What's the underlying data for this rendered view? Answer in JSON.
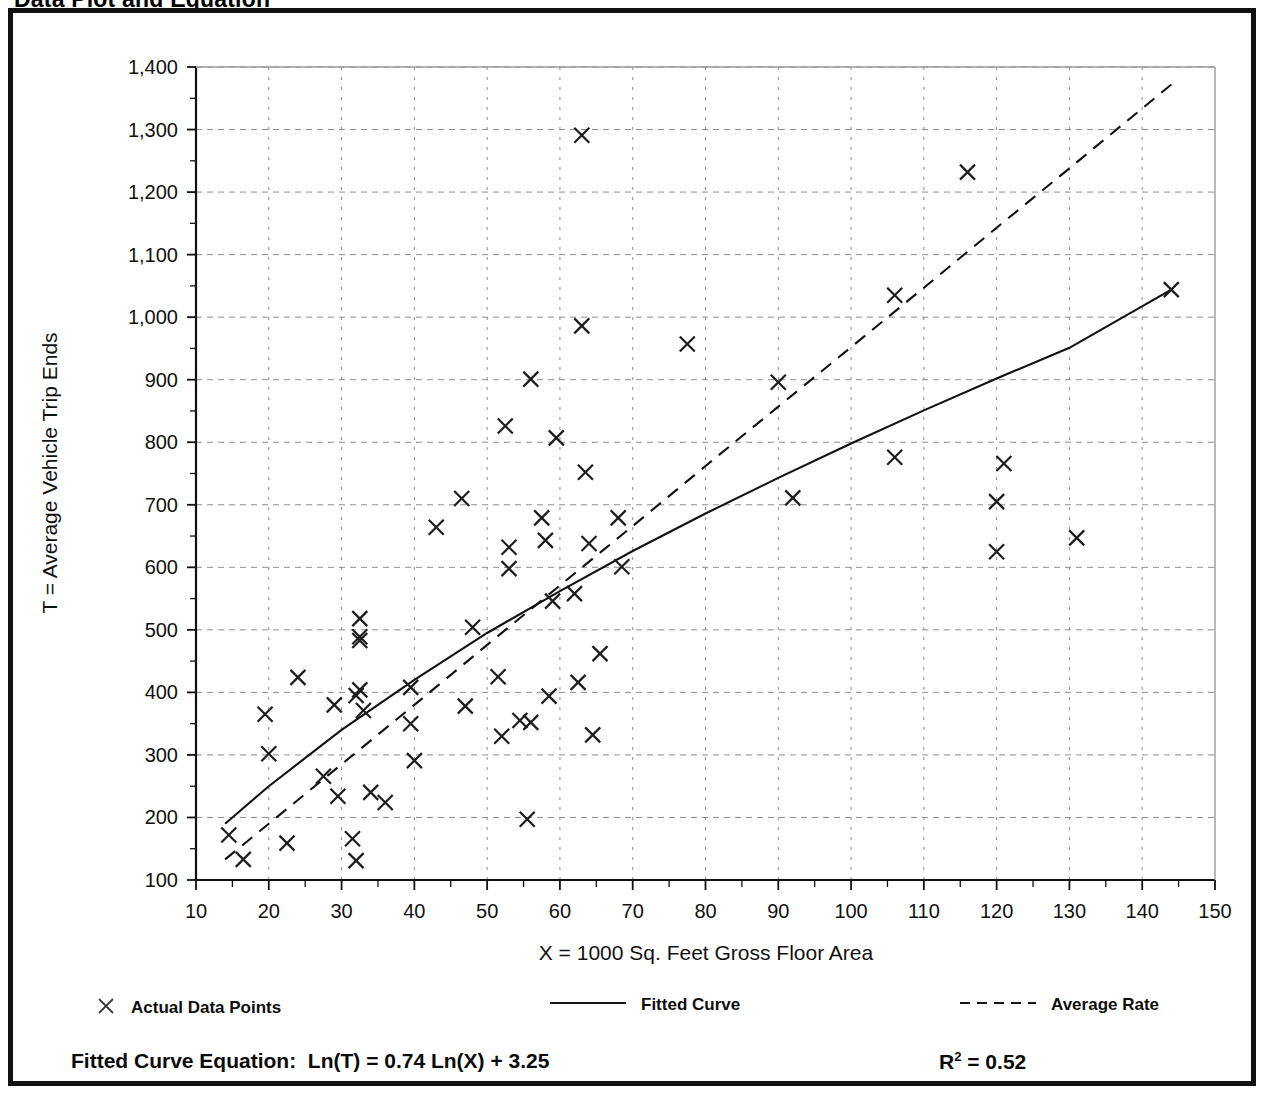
{
  "page_title": "Data Plot and Equation",
  "axes": {
    "y_title": "T = Average Vehicle Trip Ends",
    "x_title": "X = 1000 Sq. Feet Gross Floor Area"
  },
  "legend": {
    "items": [
      {
        "label": "Actual Data Points",
        "marker": "x-marker-icon"
      },
      {
        "label": "Fitted Curve",
        "marker": "solid-line-icon"
      },
      {
        "label": "Average Rate",
        "marker": "dashed-line-icon"
      }
    ]
  },
  "equation": {
    "fitted_label": "Fitted Curve Equation:",
    "fitted_formula": "Ln(T) = 0.74 Ln(X) + 3.25",
    "r_squared_base": "R",
    "r_squared_exp": "2",
    "r_squared_value": "= 0.52"
  },
  "colors": {
    "frame": "#111111",
    "ink": "#111111",
    "grid": "#8d8d8d",
    "marker": "#1d1d1d"
  },
  "chart_data": {
    "type": "scatter",
    "title": "Data Plot and Equation",
    "xlabel": "X = 1000 Sq. Feet Gross Floor Area",
    "ylabel": "T = Average Vehicle Trip Ends",
    "xlim": [
      10,
      150
    ],
    "ylim": [
      100,
      1400
    ],
    "xticks": [
      10,
      20,
      30,
      40,
      50,
      60,
      70,
      80,
      90,
      100,
      110,
      120,
      130,
      140,
      150
    ],
    "yticks": [
      100,
      200,
      300,
      400,
      500,
      600,
      700,
      800,
      900,
      1000,
      1100,
      1200,
      1300,
      1400
    ],
    "ytick_labels": [
      "100",
      "200",
      "300",
      "400",
      "500",
      "600",
      "700",
      "800",
      "900",
      "1,000",
      "1,100",
      "1,200",
      "1,300",
      "1,400"
    ],
    "xtick_labels": [
      "10",
      "20",
      "30",
      "40",
      "50",
      "60",
      "70",
      "80",
      "90",
      "100",
      "110",
      "120",
      "130",
      "140",
      "150"
    ],
    "grid": true,
    "minor_ticks": true,
    "legend_position": "below",
    "series": [
      {
        "name": "Actual Data Points",
        "type": "scatter",
        "marker": "x",
        "points": [
          [
            14.5,
            172
          ],
          [
            16.5,
            133
          ],
          [
            19.5,
            365
          ],
          [
            20,
            302
          ],
          [
            22.5,
            159
          ],
          [
            24,
            424
          ],
          [
            27.5,
            266
          ],
          [
            29,
            380
          ],
          [
            29.5,
            234
          ],
          [
            31.5,
            166
          ],
          [
            32,
            131
          ],
          [
            32,
            395
          ],
          [
            32.5,
            404
          ],
          [
            32.5,
            518
          ],
          [
            32.5,
            489
          ],
          [
            32.5,
            483
          ],
          [
            33,
            371
          ],
          [
            34,
            240
          ],
          [
            36,
            224
          ],
          [
            39.5,
            408
          ],
          [
            39.5,
            350
          ],
          [
            40,
            291
          ],
          [
            43,
            664
          ],
          [
            46.5,
            710
          ],
          [
            47,
            378
          ],
          [
            48,
            504
          ],
          [
            51.5,
            425
          ],
          [
            52,
            330
          ],
          [
            52.5,
            826
          ],
          [
            53,
            632
          ],
          [
            53,
            598
          ],
          [
            54.5,
            355
          ],
          [
            55.5,
            197
          ],
          [
            56,
            352
          ],
          [
            56,
            901
          ],
          [
            57.5,
            679
          ],
          [
            58,
            643
          ],
          [
            58.5,
            394
          ],
          [
            59,
            546
          ],
          [
            59.5,
            807
          ],
          [
            62,
            558
          ],
          [
            62.5,
            416
          ],
          [
            63,
            1291
          ],
          [
            63,
            986
          ],
          [
            63.5,
            752
          ],
          [
            64,
            638
          ],
          [
            64.5,
            332
          ],
          [
            65.5,
            462
          ],
          [
            68,
            679
          ],
          [
            68.5,
            601
          ],
          [
            77.5,
            957
          ],
          [
            90,
            896
          ],
          [
            92,
            711
          ],
          [
            106,
            1035
          ],
          [
            106,
            776
          ],
          [
            116,
            1232
          ],
          [
            120,
            705
          ],
          [
            120,
            625
          ],
          [
            121,
            766
          ],
          [
            131,
            647
          ],
          [
            144,
            1044
          ]
        ]
      },
      {
        "name": "Fitted Curve",
        "type": "line",
        "style": "solid",
        "equation": "Ln(T) = 0.74 Ln(X) + 3.25",
        "r_squared": 0.52,
        "points": [
          [
            14,
            190
          ],
          [
            20,
            250
          ],
          [
            30,
            340
          ],
          [
            40,
            420
          ],
          [
            50,
            495
          ],
          [
            60,
            562
          ],
          [
            70,
            626
          ],
          [
            80,
            686
          ],
          [
            90,
            743
          ],
          [
            100,
            798
          ],
          [
            110,
            851
          ],
          [
            120,
            902
          ],
          [
            130,
            951
          ],
          [
            144,
            1044
          ]
        ]
      },
      {
        "name": "Average Rate",
        "type": "line",
        "style": "dashed",
        "points": [
          [
            14,
            133
          ],
          [
            20,
            190
          ],
          [
            30,
            285
          ],
          [
            40,
            380
          ],
          [
            50,
            476
          ],
          [
            60,
            571
          ],
          [
            70,
            666
          ],
          [
            80,
            762
          ],
          [
            90,
            857
          ],
          [
            100,
            952
          ],
          [
            110,
            1047
          ],
          [
            120,
            1143
          ],
          [
            130,
            1238
          ],
          [
            144,
            1372
          ]
        ]
      }
    ]
  }
}
